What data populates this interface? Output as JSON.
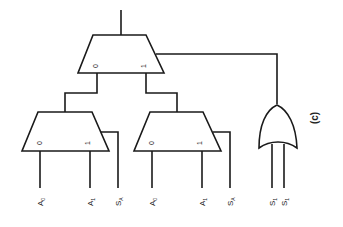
{
  "diagram": {
    "type": "multiplexer-tree",
    "caption": "(c)",
    "top_mux": {
      "input_0_label": "0",
      "input_1_label": "1"
    },
    "left_mux": {
      "input_0_label": "0",
      "input_1_label": "1"
    },
    "right_mux": {
      "input_0_label": "0",
      "input_1_label": "1"
    },
    "or_gate": {
      "inputs": 2
    },
    "signals": [
      {
        "base": "A",
        "sub": "0"
      },
      {
        "base": "A",
        "sub": "1"
      },
      {
        "base": "S",
        "sub": "A"
      },
      {
        "base": "A",
        "sub": "0"
      },
      {
        "base": "A",
        "sub": "1"
      },
      {
        "base": "S",
        "sub": "A"
      },
      {
        "base": "S",
        "sub": "1"
      },
      {
        "base": "S",
        "sub": "1"
      }
    ],
    "colors": {
      "line": "#1a1a1a",
      "background": "#ffffff"
    }
  }
}
